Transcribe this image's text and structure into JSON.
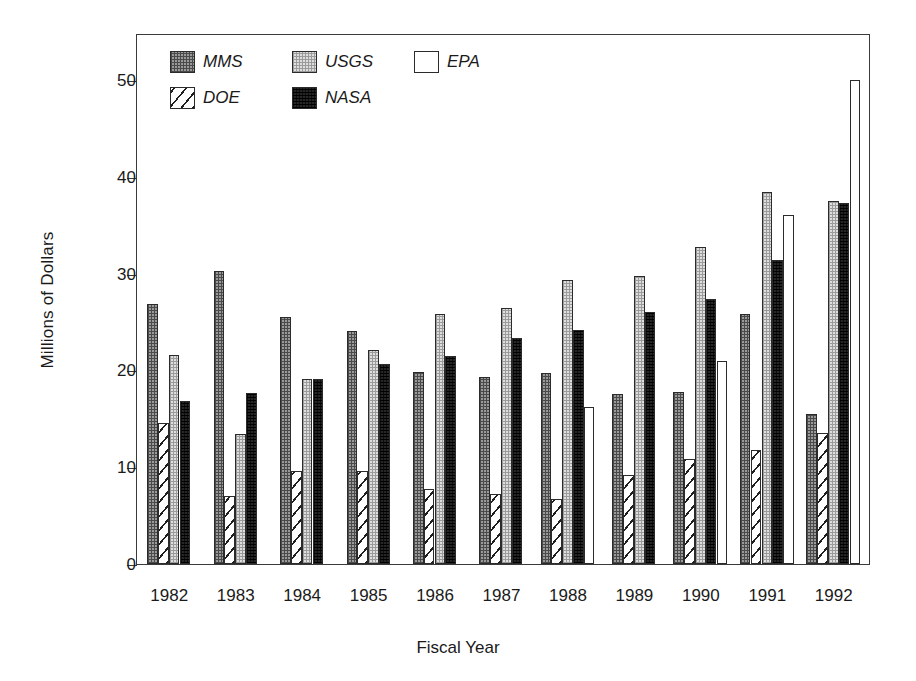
{
  "chart_data": {
    "type": "bar",
    "title": "",
    "xlabel": "Fiscal Year",
    "ylabel": "Millions of Dollars",
    "categories": [
      "1982",
      "1983",
      "1984",
      "1985",
      "1986",
      "1987",
      "1988",
      "1989",
      "1990",
      "1991",
      "1992"
    ],
    "ylim": [
      0,
      55
    ],
    "yticks": [
      0,
      10,
      20,
      30,
      40,
      50
    ],
    "ytick_labels": [
      "0",
      "10",
      "20",
      "30",
      "40",
      "50"
    ],
    "grid": false,
    "legend_position": "upper-left-inside",
    "series": [
      {
        "name": "MMS",
        "pattern": "dark-speckled",
        "values": [
          26.9,
          30.3,
          25.5,
          24.1,
          19.8,
          19.3,
          19.7,
          17.6,
          17.8,
          25.8,
          15.5
        ]
      },
      {
        "name": "DOE",
        "pattern": "diagonal-hatch",
        "values": [
          14.6,
          7.0,
          9.6,
          9.6,
          7.8,
          7.2,
          6.7,
          9.2,
          10.8,
          11.8,
          13.5
        ]
      },
      {
        "name": "USGS",
        "pattern": "light-speckled",
        "values": [
          21.6,
          13.4,
          19.1,
          22.1,
          25.8,
          26.4,
          29.3,
          29.8,
          32.8,
          38.4,
          37.5
        ]
      },
      {
        "name": "NASA",
        "pattern": "solid-black",
        "values": [
          16.8,
          17.7,
          19.1,
          20.7,
          21.5,
          23.3,
          24.2,
          26.0,
          27.4,
          31.4,
          37.3
        ]
      },
      {
        "name": "EPA",
        "pattern": "white",
        "values": [
          null,
          null,
          null,
          null,
          null,
          null,
          16.2,
          null,
          21.0,
          36.1,
          50.0
        ]
      }
    ]
  },
  "legend": {
    "items": [
      {
        "label": "MMS",
        "swatch": "swatch-mms-dark-speckled"
      },
      {
        "label": "USGS",
        "swatch": "swatch-usgs-light-speckled"
      },
      {
        "label": "EPA",
        "swatch": "swatch-epa-white"
      },
      {
        "label": "DOE",
        "swatch": "swatch-doe-diagonal-hatch"
      },
      {
        "label": "NASA",
        "swatch": "swatch-nasa-solid-black"
      }
    ]
  },
  "colors": {
    "axis": "#3a3a3a",
    "text": "#1a1a1a",
    "mms": "#9a9a9a",
    "usgs": "#dedede",
    "nasa": "#262626",
    "epa": "#ffffff",
    "doe": "#ffffff"
  }
}
